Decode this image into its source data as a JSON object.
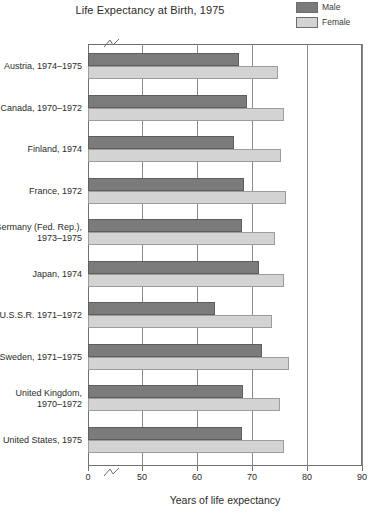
{
  "chart_data": {
    "type": "bar",
    "orientation": "horizontal",
    "title": "Life Expectancy at Birth, 1975",
    "xlabel": "Years of life expectancy",
    "ylabel": "",
    "xlim": [
      0,
      90
    ],
    "axis_break": "between 0 and 50",
    "grid": true,
    "legend_position": "top-right",
    "categories": [
      "Austria, 1974–1975",
      "Canada, 1970–1972",
      "Finland, 1974",
      "France, 1972",
      "Germany (Fed. Rep.), 1973–1975",
      "Japan, 1974",
      "U.S.S.R. 1971–1972",
      "Sweden, 1971–1975",
      "United Kingdom, 1970–1972",
      "United States, 1975"
    ],
    "series": [
      {
        "name": "Male",
        "color": "#7b7b7b",
        "values": [
          67.7,
          69.0,
          66.8,
          68.6,
          68.1,
          71.2,
          63.2,
          71.8,
          68.4,
          68.2
        ]
      },
      {
        "name": "Female",
        "color": "#d3d3d3",
        "values": [
          74.8,
          75.8,
          75.2,
          76.1,
          74.2,
          75.9,
          73.6,
          76.8,
          75.0,
          75.9
        ]
      }
    ],
    "xticks": [
      0,
      50,
      60,
      70,
      80,
      90
    ],
    "xticklabels": [
      "0",
      "50",
      "60",
      "70",
      "80",
      "90"
    ]
  },
  "legend": {
    "items": [
      {
        "label": "Male",
        "color": "#7b7b7b"
      },
      {
        "label": "Female",
        "color": "#d3d3d3"
      }
    ]
  },
  "category_lines": [
    [
      "Austria, 1974–1975"
    ],
    [
      "Canada, 1970–1972"
    ],
    [
      "Finland, 1974"
    ],
    [
      "France, 1972"
    ],
    [
      "Germany (Fed. Rep.),",
      "1973–1975"
    ],
    [
      "Japan, 1974"
    ],
    [
      "U.S.S.R. 1971–1972"
    ],
    [
      "Sweden, 1971–1975"
    ],
    [
      "United Kingdom,",
      "1970–1972"
    ],
    [
      "United States, 1975"
    ]
  ]
}
